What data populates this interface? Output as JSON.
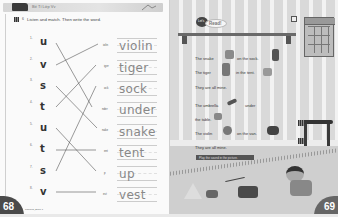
{
  "left_page": {
    "unit_label": "Unit",
    "header_title": "Bé Tí Lớp Vv",
    "exercise_number": "6",
    "instruction": "Listen and match. Then write the word.",
    "items": [
      {
        "num": "1.",
        "letter": "u",
        "partial": "iolin",
        "word": "violin"
      },
      {
        "num": "2.",
        "letter": "v",
        "partial": "iger",
        "word": "tiger"
      },
      {
        "num": "3.",
        "letter": "s",
        "partial": "ock",
        "word": "sock"
      },
      {
        "num": "4.",
        "letter": "t",
        "partial": "nder",
        "word": "under"
      },
      {
        "num": "5.",
        "letter": "u",
        "partial": "nake",
        "word": "snake"
      },
      {
        "num": "6.",
        "letter": "t",
        "partial": "ent",
        "word": "tent"
      },
      {
        "num": "7.",
        "letter": "s",
        "partial": "p",
        "word": "up"
      },
      {
        "num": "8.",
        "letter": "v",
        "partial": "est",
        "word": "vest"
      }
    ],
    "page_number": "68",
    "footer": "Phonics_Book 1"
  },
  "right_page": {
    "badge_lets": "Let's",
    "badge_read": "Read!",
    "sentences": [
      "The snake",
      "on the sock.",
      "The tiger",
      "in the tent.",
      "They are all mine.",
      "The umbrella",
      "under",
      "the table.",
      "The violin",
      "on the van.",
      "They are all mine."
    ],
    "qr_labels": [
      "...",
      "..."
    ],
    "banner_text": "Play the sound in the picture.",
    "page_number": "69"
  },
  "colors": {
    "page_bg": "#fafafa",
    "tab_dark": "#4a4a4a",
    "word_gray": "#888888"
  }
}
